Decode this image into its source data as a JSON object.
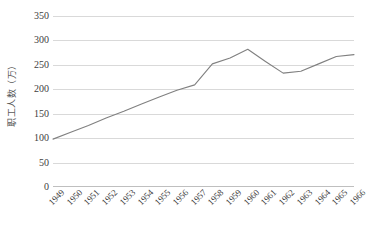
{
  "chart_data": {
    "type": "line",
    "title": "",
    "subtitle": "",
    "xlabel": "",
    "ylabel": "职工人数（万）",
    "categories": [
      "1949",
      "1950",
      "1951",
      "1952",
      "1953",
      "1954",
      "1955",
      "1956",
      "1957",
      "1958",
      "1959",
      "1960",
      "1961",
      "1962",
      "1963",
      "1964",
      "1965",
      "1966"
    ],
    "series": [
      {
        "name": "职工人数",
        "values": [
          98,
          112,
          126,
          141,
          155,
          170,
          184,
          198,
          209,
          252,
          264,
          282,
          257,
          233,
          237,
          252,
          267,
          271
        ]
      }
    ],
    "ylim": [
      0,
      350
    ],
    "yticks": [
      0,
      50,
      100,
      150,
      200,
      250,
      300,
      350
    ],
    "ytick_labels": [
      "0",
      "50",
      "100",
      "150",
      "200",
      "250",
      "300",
      "350"
    ],
    "grid": true,
    "grid_axis": "y",
    "legend": false,
    "legend_position": "none",
    "annotations": [],
    "colors": {
      "line": "#808080",
      "gridline": "#d9d9d9",
      "baseline": "#bfbfbf",
      "tick_label": "#404040",
      "axis_title": "#595959",
      "background": "#ffffff"
    }
  }
}
